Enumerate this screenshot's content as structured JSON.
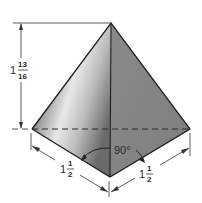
{
  "diagram": {
    "dimensions": {
      "height": {
        "whole": "1",
        "num": "13",
        "den": "16"
      },
      "left_base_edge": {
        "whole": "1",
        "num": "1",
        "den": "2"
      },
      "right_base_edge": {
        "whole": "1",
        "num": "1",
        "den": "2"
      },
      "base_angle": "90°"
    },
    "colors": {
      "left_face_light": "#e4e4e4",
      "left_face_dark": "#7a7a7a",
      "right_face": "#8c8c8c",
      "edge": "#1e1e1e",
      "dimension_line": "#333333"
    }
  }
}
